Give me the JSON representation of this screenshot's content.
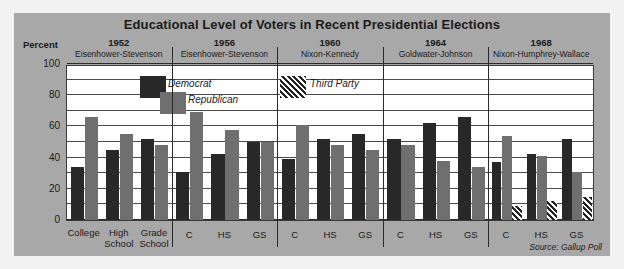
{
  "chart_data": {
    "type": "bar",
    "title": "Educational Level of Voters in Recent Presidential Elections",
    "ylabel": "Percent",
    "xlabel": "",
    "ylim": [
      0,
      100
    ],
    "yticks": [
      0,
      20,
      40,
      60,
      80,
      100
    ],
    "ytick_labels": [
      "0",
      "20",
      "40",
      "60",
      "80",
      "100"
    ],
    "gridlines_every": 10,
    "grid": true,
    "legend": [
      "Democrat",
      "Republican",
      "Third Party"
    ],
    "legend_position": "inside-top",
    "source": "Source: Gallup Poll",
    "categories": [
      "College",
      "High School",
      "Grade School"
    ],
    "category_short": [
      "C",
      "HS",
      "GS"
    ],
    "groups": [
      {
        "year": "1952",
        "candidates": "Eisenhower-Stevenson",
        "labels_long": true,
        "series": [
          {
            "name": "Democrat",
            "values": [
              34,
              45,
              52
            ]
          },
          {
            "name": "Republican",
            "values": [
              66,
              55,
              48
            ]
          }
        ]
      },
      {
        "year": "1956",
        "candidates": "Eisenhower-Stevenson",
        "labels_long": false,
        "series": [
          {
            "name": "Democrat",
            "values": [
              31,
              42,
              50
            ]
          },
          {
            "name": "Republican",
            "values": [
              69,
              58,
              50
            ]
          }
        ]
      },
      {
        "year": "1960",
        "candidates": "Nixon-Kennedy",
        "labels_long": false,
        "series": [
          {
            "name": "Democrat",
            "values": [
              39,
              52,
              55
            ]
          },
          {
            "name": "Republican",
            "values": [
              61,
              48,
              45
            ]
          }
        ]
      },
      {
        "year": "1964",
        "candidates": "Goldwater-Johnson",
        "labels_long": false,
        "series": [
          {
            "name": "Democrat",
            "values": [
              52,
              62,
              66
            ]
          },
          {
            "name": "Republican",
            "values": [
              48,
              38,
              34
            ]
          }
        ]
      },
      {
        "year": "1968",
        "candidates": "Nixon-Humphrey-Wallace",
        "labels_long": false,
        "series": [
          {
            "name": "Democrat",
            "values": [
              37,
              42,
              52
            ]
          },
          {
            "name": "Republican",
            "values": [
              54,
              41,
              31
            ]
          },
          {
            "name": "Third Party",
            "values": [
              9,
              12,
              15
            ]
          }
        ]
      }
    ]
  },
  "colors": {
    "democrat": "#282828",
    "republican": "#6f6f6f",
    "third_party": "#232323",
    "background": "#a8a8a8",
    "plot_background": "#ffffff"
  }
}
